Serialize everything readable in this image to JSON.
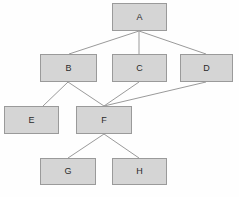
{
  "diagram": {
    "type": "directed-acyclic-graph",
    "title": "",
    "canvas": {
      "width": 239,
      "height": 197
    },
    "style": {
      "background": "#fefefe",
      "node_fill": "#d5d5d5",
      "node_border": "#9a9a9a",
      "edge_color": "#9a9a9a",
      "label_color": "#2b2b2b"
    },
    "nodes": [
      {
        "id": "A",
        "label": "A",
        "x": 112,
        "y": 3,
        "w": 55,
        "h": 28
      },
      {
        "id": "B",
        "label": "B",
        "x": 40,
        "y": 54,
        "w": 57,
        "h": 28
      },
      {
        "id": "C",
        "label": "C",
        "x": 112,
        "y": 54,
        "w": 55,
        "h": 28
      },
      {
        "id": "D",
        "label": "D",
        "x": 180,
        "y": 54,
        "w": 53,
        "h": 28
      },
      {
        "id": "E",
        "label": "E",
        "x": 4,
        "y": 106,
        "w": 55,
        "h": 28
      },
      {
        "id": "F",
        "label": "F",
        "x": 76,
        "y": 106,
        "w": 56,
        "h": 28
      },
      {
        "id": "G",
        "label": "G",
        "x": 40,
        "y": 158,
        "w": 56,
        "h": 27
      },
      {
        "id": "H",
        "label": "H",
        "x": 112,
        "y": 158,
        "w": 55,
        "h": 27
      }
    ],
    "edges": [
      {
        "from": "A",
        "to": "B",
        "x1": 139,
        "y1": 31,
        "x2": 69,
        "y2": 54
      },
      {
        "from": "A",
        "to": "C",
        "x1": 139,
        "y1": 31,
        "x2": 139,
        "y2": 54
      },
      {
        "from": "A",
        "to": "D",
        "x1": 139,
        "y1": 31,
        "x2": 206,
        "y2": 54
      },
      {
        "from": "B",
        "to": "E",
        "x1": 68,
        "y1": 82,
        "x2": 43,
        "y2": 106
      },
      {
        "from": "B",
        "to": "F",
        "x1": 68,
        "y1": 82,
        "x2": 104,
        "y2": 106
      },
      {
        "from": "C",
        "to": "F",
        "x1": 139,
        "y1": 82,
        "x2": 104,
        "y2": 106
      },
      {
        "from": "D",
        "to": "F",
        "x1": 206,
        "y1": 82,
        "x2": 104,
        "y2": 106
      },
      {
        "from": "F",
        "to": "G",
        "x1": 104,
        "y1": 134,
        "x2": 68,
        "y2": 158
      },
      {
        "from": "F",
        "to": "H",
        "x1": 104,
        "y1": 134,
        "x2": 139,
        "y2": 158
      }
    ]
  }
}
